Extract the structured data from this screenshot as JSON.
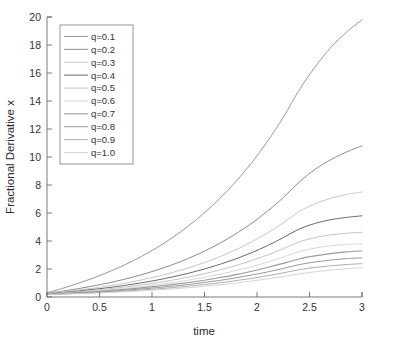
{
  "chart_data": {
    "type": "line",
    "title": "",
    "xlabel": "time",
    "ylabel": "Fractional Derivative x",
    "xlim": [
      0,
      3
    ],
    "ylim": [
      0,
      20
    ],
    "grid": false,
    "legend_position": "top-left",
    "xticks": [
      0,
      0.5,
      1,
      1.5,
      2,
      2.5,
      3
    ],
    "xtick_labels": [
      "0",
      "0.5",
      "1",
      "1.5",
      "2",
      "2.5",
      "3"
    ],
    "yticks": [
      0,
      2,
      4,
      6,
      8,
      10,
      12,
      14,
      16,
      18,
      20
    ],
    "ytick_labels": [
      "0",
      "2",
      "4",
      "6",
      "8",
      "10",
      "12",
      "14",
      "16",
      "18",
      "20"
    ],
    "x": [
      0,
      0.15,
      0.3,
      0.45,
      0.6,
      0.75,
      0.9,
      1.05,
      1.2,
      1.35,
      1.5,
      1.65,
      1.8,
      1.95,
      2.1,
      2.25,
      2.4,
      2.55,
      2.7,
      2.85,
      3
    ],
    "series": [
      {
        "name": "q=0.1",
        "color": "#8c8c8c",
        "width": 0.9,
        "values": [
          0.3,
          0.62,
          0.98,
          1.38,
          1.83,
          2.33,
          2.9,
          3.54,
          4.27,
          5.09,
          6.02,
          7.07,
          8.26,
          9.6,
          11.12,
          12.83,
          14.76,
          16.4,
          17.8,
          18.9,
          19.8
        ]
      },
      {
        "name": "q=0.2",
        "color": "#7f7f7f",
        "width": 0.9,
        "values": [
          0.26,
          0.42,
          0.6,
          0.8,
          1.03,
          1.29,
          1.59,
          1.93,
          2.32,
          2.77,
          3.28,
          3.86,
          4.52,
          5.27,
          6.13,
          7.1,
          8.2,
          9.1,
          9.8,
          10.35,
          10.8
        ]
      },
      {
        "name": "q=0.3",
        "color": "#c8c8c8",
        "width": 1.0,
        "values": [
          0.24,
          0.36,
          0.49,
          0.64,
          0.81,
          1.0,
          1.22,
          1.47,
          1.76,
          2.09,
          2.46,
          2.89,
          3.38,
          3.94,
          4.58,
          5.3,
          6.1,
          6.65,
          7.05,
          7.32,
          7.5
        ]
      },
      {
        "name": "q=0.4",
        "color": "#6a6a6a",
        "width": 1.0,
        "values": [
          0.23,
          0.32,
          0.43,
          0.55,
          0.68,
          0.84,
          1.01,
          1.21,
          1.44,
          1.7,
          2.0,
          2.34,
          2.73,
          3.17,
          3.67,
          4.24,
          4.85,
          5.25,
          5.52,
          5.68,
          5.8
        ]
      },
      {
        "name": "q=0.5",
        "color": "#bdbdbd",
        "width": 0.9,
        "values": [
          0.22,
          0.29,
          0.38,
          0.48,
          0.59,
          0.72,
          0.86,
          1.02,
          1.21,
          1.42,
          1.66,
          1.94,
          2.25,
          2.6,
          3.0,
          3.45,
          3.93,
          4.24,
          4.44,
          4.55,
          4.62
        ]
      },
      {
        "name": "q=0.6",
        "color": "#d2d2d2",
        "width": 0.9,
        "values": [
          0.21,
          0.27,
          0.34,
          0.43,
          0.52,
          0.63,
          0.75,
          0.88,
          1.04,
          1.21,
          1.41,
          1.63,
          1.89,
          2.17,
          2.49,
          2.85,
          3.24,
          3.49,
          3.66,
          3.75,
          3.8
        ]
      },
      {
        "name": "q=0.7",
        "color": "#9a9a9a",
        "width": 1.1,
        "values": [
          0.2,
          0.25,
          0.31,
          0.38,
          0.46,
          0.55,
          0.65,
          0.77,
          0.9,
          1.04,
          1.2,
          1.39,
          1.6,
          1.84,
          2.11,
          2.4,
          2.72,
          2.94,
          3.1,
          3.22,
          3.3
        ]
      },
      {
        "name": "q=0.8",
        "color": "#8f8f8f",
        "width": 0.9,
        "values": [
          0.19,
          0.23,
          0.28,
          0.34,
          0.41,
          0.49,
          0.57,
          0.67,
          0.78,
          0.9,
          1.04,
          1.19,
          1.37,
          1.57,
          1.79,
          2.04,
          2.31,
          2.5,
          2.64,
          2.74,
          2.8
        ]
      },
      {
        "name": "q=0.9",
        "color": "#a5a5a5",
        "width": 0.9,
        "values": [
          0.18,
          0.22,
          0.26,
          0.31,
          0.36,
          0.43,
          0.5,
          0.58,
          0.67,
          0.78,
          0.89,
          1.02,
          1.17,
          1.33,
          1.52,
          1.72,
          1.95,
          2.11,
          2.23,
          2.32,
          2.38
        ]
      },
      {
        "name": "q=1.0",
        "color": "#cfcfcf",
        "width": 0.9,
        "values": [
          0.18,
          0.21,
          0.24,
          0.28,
          0.33,
          0.38,
          0.44,
          0.51,
          0.58,
          0.67,
          0.77,
          0.88,
          1.0,
          1.14,
          1.29,
          1.46,
          1.65,
          1.8,
          1.92,
          2.02,
          2.1
        ]
      }
    ]
  },
  "axes": {
    "xlabel": "time",
    "ylabel": "Fractional Derivative x"
  },
  "legend": {
    "entries": [
      {
        "label": "q=0.1"
      },
      {
        "label": "q=0.2"
      },
      {
        "label": "q=0.3"
      },
      {
        "label": "q=0.4"
      },
      {
        "label": "q=0.5"
      },
      {
        "label": "q=0.6"
      },
      {
        "label": "q=0.7"
      },
      {
        "label": "q=0.8"
      },
      {
        "label": "q=0.9"
      },
      {
        "label": "q=1.0"
      }
    ]
  }
}
